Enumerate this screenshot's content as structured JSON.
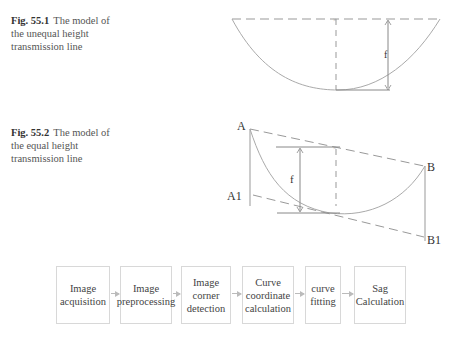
{
  "figures": [
    {
      "number": "Fig. 55.1",
      "caption": "The model of the unequal height transmission line",
      "labels": {
        "sag": "f"
      }
    },
    {
      "number": "Fig. 55.2",
      "caption": "The model of the equal height transmission line",
      "labels": {
        "point_a": "A",
        "point_a1": "A1",
        "point_b": "B",
        "point_b1": "B1",
        "sag": "f"
      }
    }
  ],
  "flowchart": {
    "steps": [
      {
        "label": "Image acquisition"
      },
      {
        "label": "Image preprocessing"
      },
      {
        "label": "Image corner detection"
      },
      {
        "label": "Curve coordinate calculation"
      },
      {
        "label": "curve fitting"
      },
      {
        "label": "Sag Calculation"
      }
    ]
  }
}
